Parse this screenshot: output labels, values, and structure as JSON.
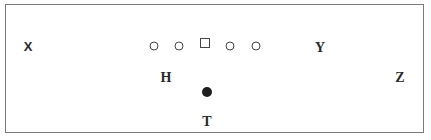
{
  "diagram": {
    "type": "football-formation",
    "line": [
      {
        "symbol": "circle",
        "role": "lineman"
      },
      {
        "symbol": "circle",
        "role": "lineman"
      },
      {
        "symbol": "square",
        "role": "center"
      },
      {
        "symbol": "circle",
        "role": "lineman"
      },
      {
        "symbol": "circle",
        "role": "lineman"
      }
    ],
    "players": {
      "x": "X",
      "y": "Y",
      "h": "H",
      "z": "Z",
      "t": "T"
    },
    "ball_carrier": {
      "symbol": "filled-circle"
    },
    "colors": {
      "border": "#7a7a7a",
      "ink": "#2a2a2a",
      "background": "#ffffff"
    }
  }
}
